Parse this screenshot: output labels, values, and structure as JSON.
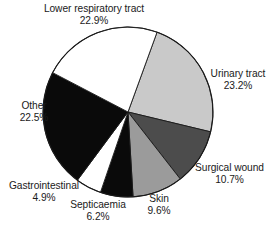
{
  "chart_data": {
    "type": "pie",
    "title": "",
    "subtitle": "",
    "xlabel": "",
    "ylabel": "",
    "legend_position": "none",
    "grid": false,
    "labels_show_percent": true,
    "center": {
      "x": 128,
      "y": 112
    },
    "radius": 85,
    "start_angle_deg": 20,
    "direction": "clockwise",
    "categories": [
      "Urinary tract",
      "Surgical wound",
      "Skin",
      "Septicaemia",
      "Gastrointestinal",
      "Other",
      "Lower respiratory tract"
    ],
    "values": [
      23.2,
      10.7,
      9.6,
      6.2,
      4.9,
      22.5,
      22.9
    ],
    "slices": [
      {
        "name": "Urinary tract",
        "label": "Urinary tract",
        "value": 23.2,
        "value_text": "23.2%",
        "fill": "#c9c9c9",
        "stroke": "#1a1a1a"
      },
      {
        "name": "Surgical wound",
        "label": "Surgical wound",
        "value": 10.7,
        "value_text": "10.7%",
        "fill": "#4c4c4c",
        "stroke": "#1a1a1a"
      },
      {
        "name": "Skin",
        "label": "Skin",
        "value": 9.6,
        "value_text": "9.6%",
        "fill": "#9b9b9b",
        "stroke": "#1a1a1a"
      },
      {
        "name": "Septicaemia",
        "label": "Septicaemia",
        "value": 6.2,
        "value_text": "6.2%",
        "fill": "#0a0a0a",
        "stroke": "#1a1a1a"
      },
      {
        "name": "Gastrointestinal",
        "label": "Gastrointestinal",
        "value": 4.9,
        "value_text": "4.9%",
        "fill": "#ffffff",
        "stroke": "#1a1a1a"
      },
      {
        "name": "Other",
        "label": "Other",
        "value": 22.5,
        "value_text": "22.5%",
        "fill": "#0a0a0a",
        "stroke": "#1a1a1a"
      },
      {
        "name": "Lower respiratory tract",
        "label": "Lower respiratory tract",
        "value": 22.9,
        "value_text": "22.9%",
        "fill": "#ffffff",
        "stroke": "#1a1a1a"
      }
    ]
  },
  "annotations": {
    "lower_respiratory": {
      "label": "Lower respiratory tract",
      "value": "22.9%"
    },
    "urinary": {
      "label": "Urinary tract",
      "value": "23.2%"
    },
    "surgical": {
      "label": "Surgical wound",
      "value": "10.7%"
    },
    "skin": {
      "label": "Skin",
      "value": "9.6%"
    },
    "septicaemia": {
      "label": "Septicaemia",
      "value": "6.2%"
    },
    "gastrointestinal": {
      "label": "Gastrointestinal",
      "value": "4.9%"
    },
    "other": {
      "label": "Other",
      "value": "22.5%"
    }
  },
  "colors": {
    "background": "#ffffff",
    "outline": "#1a1a1a",
    "text": "#1a1a1a",
    "light_gray": "#c9c9c9",
    "medium_gray": "#9b9b9b",
    "dark_gray": "#4c4c4c",
    "black": "#0a0a0a",
    "white": "#ffffff"
  }
}
